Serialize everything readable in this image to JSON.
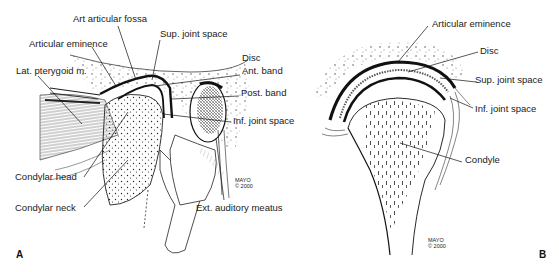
{
  "figure": {
    "type": "anatomical-illustration",
    "panels": [
      {
        "id": "A",
        "letter": "A",
        "view": "sagittal",
        "labels": {
          "art_articular_fossa": "Art articular fossa",
          "sup_joint_space": "Sup. joint space",
          "articular_eminence": "Articular eminence",
          "disc": "Disc",
          "ant_band": "Ant. band",
          "lat_pterygoid": "Lat. pterygoid m.",
          "post_band": "Post. band",
          "inf_joint_space": "Inf. joint space",
          "condylar_head": "Condylar head",
          "condylar_neck": "Condylar neck",
          "ext_auditory_meatus": "Ext. auditory meatus"
        },
        "credit": {
          "line1": "MAYO",
          "line2": "© 2000"
        }
      },
      {
        "id": "B",
        "letter": "B",
        "view": "coronal",
        "labels": {
          "articular_eminence": "Articular eminence",
          "disc": "Disc",
          "sup_joint_space": "Sup. joint space",
          "inf_joint_space": "Inf. joint space",
          "condyle": "Condyle"
        },
        "credit": {
          "line1": "MAYO",
          "line2": "© 2000"
        }
      }
    ]
  },
  "colors": {
    "background": "#ffffff",
    "ink": "#111111",
    "label": "#1a1a1a",
    "shade": "#555555"
  }
}
